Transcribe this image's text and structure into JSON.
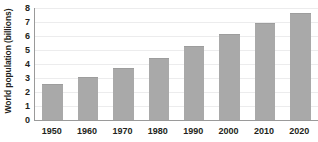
{
  "chart_data": {
    "type": "bar",
    "title": "",
    "subtitle": "",
    "xlabel": "",
    "ylabel": "World population (billions)",
    "categories": [
      "1950",
      "1960",
      "1970",
      "1980",
      "1990",
      "2000",
      "2010",
      "2020"
    ],
    "values": [
      2.55,
      3.05,
      3.7,
      4.45,
      5.3,
      6.15,
      6.9,
      7.65
    ],
    "series": [
      {
        "name": "World population",
        "values": [
          2.55,
          3.05,
          3.7,
          4.45,
          5.3,
          6.15,
          6.9,
          7.65
        ]
      }
    ],
    "ylim": [
      0,
      8
    ],
    "yticks": [
      0,
      1,
      2,
      3,
      4,
      5,
      6,
      7,
      8
    ],
    "ytick_labels": [
      "0",
      "1",
      "2",
      "3",
      "4",
      "5",
      "6",
      "7",
      "8"
    ],
    "grid": true,
    "grid_axis": "y",
    "legend": false,
    "legend_position": "none",
    "annotations": [],
    "colors": {
      "bar_fill": "#a9a9a9",
      "bar_edge": "#9d9d9d",
      "axis_line": "#9a9a9a",
      "gridline": "#ececed",
      "text": "#231f20",
      "background": "#ffffff"
    }
  }
}
